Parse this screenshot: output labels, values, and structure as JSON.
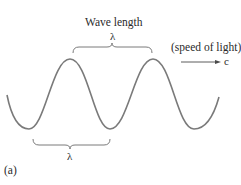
{
  "figure": {
    "panel_label": "(a)",
    "wave": {
      "color": "#7a7a7a",
      "cycles_visible": 2.5,
      "direction": "right"
    },
    "top_annotation": {
      "title": "Wave length",
      "symbol": "λ",
      "spans": "peak-to-peak"
    },
    "bottom_annotation": {
      "symbol": "λ",
      "spans": "trough-to-trough"
    },
    "propagation": {
      "label": "(speed of light)",
      "symbol": "c"
    }
  }
}
